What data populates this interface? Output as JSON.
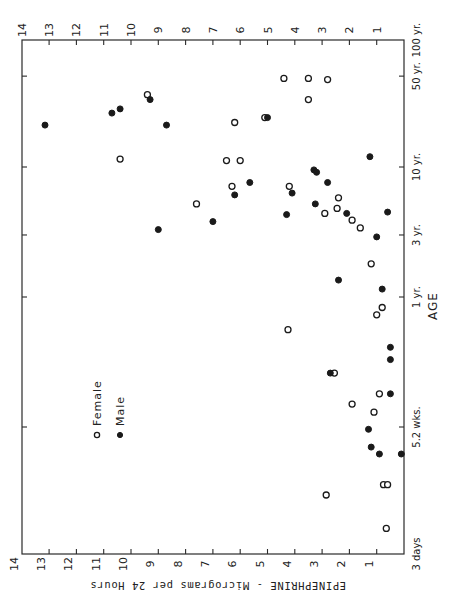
{
  "chart_data": {
    "type": "scatter",
    "orientation": "rotated-90",
    "title": "",
    "xlabel": "EPINEPHRINE - Micrograms per 24 Hours",
    "ylabel": "AGE",
    "x_scale": "linear",
    "y_scale": "log",
    "xlim": [
      0,
      14
    ],
    "x_ticks": [
      1,
      2,
      3,
      4,
      5,
      6,
      7,
      8,
      9,
      10,
      11,
      12,
      13,
      14
    ],
    "x_tick_labels": [
      "1",
      "2",
      "3",
      "4",
      "5",
      "6",
      "7",
      "8",
      "9",
      "10",
      "11",
      "12",
      "13",
      "14"
    ],
    "y_ticks_years": [
      0.0082,
      0.1,
      1,
      3,
      10,
      50,
      100
    ],
    "y_tick_labels": [
      "3 days",
      "5.2 wks.",
      "1 yr.",
      "3 yr.",
      "10 yr.",
      "50 yr.",
      "100 yr."
    ],
    "grid": false,
    "legend": {
      "placement": "lower-left",
      "entries": [
        {
          "label": "Female",
          "marker": "open-circle"
        },
        {
          "label": "Male",
          "marker": "filled-circle"
        }
      ]
    },
    "series": [
      {
        "name": "Female",
        "marker": "open-circle",
        "points": [
          {
            "epinephrine": 9.4,
            "age_years": 36
          },
          {
            "epinephrine": 10.4,
            "age_years": 11.5
          },
          {
            "epinephrine": 7.6,
            "age_years": 5.2
          },
          {
            "epinephrine": 4.4,
            "age_years": 48
          },
          {
            "epinephrine": 3.5,
            "age_years": 48
          },
          {
            "epinephrine": 2.8,
            "age_years": 47
          },
          {
            "epinephrine": 3.5,
            "age_years": 33
          },
          {
            "epinephrine": 6.2,
            "age_years": 22
          },
          {
            "epinephrine": 5.1,
            "age_years": 24
          },
          {
            "epinephrine": 6.5,
            "age_years": 11.2
          },
          {
            "epinephrine": 6.0,
            "age_years": 11.2
          },
          {
            "epinephrine": 6.3,
            "age_years": 7.1
          },
          {
            "epinephrine": 4.2,
            "age_years": 7.1
          },
          {
            "epinephrine": 2.4,
            "age_years": 5.8
          },
          {
            "epinephrine": 2.45,
            "age_years": 4.8
          },
          {
            "epinephrine": 2.9,
            "age_years": 4.4
          },
          {
            "epinephrine": 1.9,
            "age_years": 3.9
          },
          {
            "epinephrine": 1.6,
            "age_years": 3.4
          },
          {
            "epinephrine": 1.2,
            "age_years": 1.8
          },
          {
            "epinephrine": 0.8,
            "age_years": 0.83
          },
          {
            "epinephrine": 1.0,
            "age_years": 0.73
          },
          {
            "epinephrine": 4.25,
            "age_years": 0.56
          },
          {
            "epinephrine": 2.55,
            "age_years": 0.26
          },
          {
            "epinephrine": 0.9,
            "age_years": 0.18
          },
          {
            "epinephrine": 1.9,
            "age_years": 0.15
          },
          {
            "epinephrine": 1.1,
            "age_years": 0.13
          },
          {
            "epinephrine": 0.75,
            "age_years": 0.036
          },
          {
            "epinephrine": 0.6,
            "age_years": 0.036
          },
          {
            "epinephrine": 2.85,
            "age_years": 0.03
          },
          {
            "epinephrine": 0.65,
            "age_years": 0.0166
          }
        ]
      },
      {
        "name": "Male",
        "marker": "filled-circle",
        "points": [
          {
            "epinephrine": 13.15,
            "age_years": 21
          },
          {
            "epinephrine": 10.7,
            "age_years": 26
          },
          {
            "epinephrine": 10.4,
            "age_years": 28
          },
          {
            "epinephrine": 9.3,
            "age_years": 33
          },
          {
            "epinephrine": 8.7,
            "age_years": 21
          },
          {
            "epinephrine": 5.0,
            "age_years": 24
          },
          {
            "epinephrine": 9.0,
            "age_years": 3.3
          },
          {
            "epinephrine": 7.0,
            "age_years": 3.8
          },
          {
            "epinephrine": 5.65,
            "age_years": 7.6
          },
          {
            "epinephrine": 6.2,
            "age_years": 6.1
          },
          {
            "epinephrine": 4.1,
            "age_years": 6.3
          },
          {
            "epinephrine": 4.3,
            "age_years": 4.3
          },
          {
            "epinephrine": 3.3,
            "age_years": 9.5
          },
          {
            "epinephrine": 3.2,
            "age_years": 9.1
          },
          {
            "epinephrine": 2.8,
            "age_years": 7.6
          },
          {
            "epinephrine": 3.25,
            "age_years": 5.2
          },
          {
            "epinephrine": 2.1,
            "age_years": 4.4
          },
          {
            "epinephrine": 1.25,
            "age_years": 12
          },
          {
            "epinephrine": 0.6,
            "age_years": 4.5
          },
          {
            "epinephrine": 1.0,
            "age_years": 2.9
          },
          {
            "epinephrine": 2.4,
            "age_years": 1.35
          },
          {
            "epinephrine": 0.8,
            "age_years": 1.15
          },
          {
            "epinephrine": 0.5,
            "age_years": 0.41
          },
          {
            "epinephrine": 0.5,
            "age_years": 0.33
          },
          {
            "epinephrine": 2.7,
            "age_years": 0.26
          },
          {
            "epinephrine": 0.5,
            "age_years": 0.18
          },
          {
            "epinephrine": 1.3,
            "age_years": 0.096
          },
          {
            "epinephrine": 1.2,
            "age_years": 0.07
          },
          {
            "epinephrine": 0.9,
            "age_years": 0.062
          },
          {
            "epinephrine": 0.1,
            "age_years": 0.062
          }
        ]
      }
    ]
  }
}
